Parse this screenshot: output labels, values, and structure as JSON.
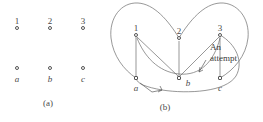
{
  "figure": {
    "caption_a": "(a)",
    "caption_b": "(b)",
    "annotation": "An\nattempt",
    "annotation_line1": "An",
    "annotation_line2": "attempt",
    "stroke_color": "#6b6b6b",
    "text_color": "#4a4a4a",
    "background": "#ffffff"
  },
  "panel_a": {
    "name": "six isolated vertices",
    "top_labels": [
      "1",
      "2",
      "3"
    ],
    "bottom_labels": [
      "a",
      "b",
      "c"
    ],
    "vertices": [
      {
        "id": "1",
        "label": "1",
        "x": 17,
        "y": 28,
        "label_pos": "above",
        "shape": "circle"
      },
      {
        "id": "2",
        "label": "2",
        "x": 50,
        "y": 28,
        "label_pos": "above",
        "shape": "circle"
      },
      {
        "id": "3",
        "label": "3",
        "x": 83,
        "y": 28,
        "label_pos": "above",
        "shape": "circle"
      },
      {
        "id": "a",
        "label": "a",
        "x": 17,
        "y": 73,
        "label_pos": "below",
        "shape": "circle"
      },
      {
        "id": "b",
        "label": "b",
        "x": 50,
        "y": 73,
        "label_pos": "below",
        "shape": "circle"
      },
      {
        "id": "c",
        "label": "c",
        "x": 83,
        "y": 73,
        "label_pos": "below",
        "shape": "circle"
      }
    ]
  },
  "panel_b": {
    "name": "attempted planar drawing of K33",
    "top_labels": [
      "1",
      "2",
      "3"
    ],
    "bottom_labels": [
      "a",
      "b",
      "c"
    ],
    "vertices": [
      {
        "id": "1",
        "label": "1",
        "x": 26,
        "y": 35,
        "label_pos": "above",
        "shape": "circle"
      },
      {
        "id": "2",
        "label": "2",
        "x": 69,
        "y": 38,
        "label_pos": "above",
        "shape": "circle"
      },
      {
        "id": "3",
        "label": "3",
        "x": 110,
        "y": 35,
        "label_pos": "above",
        "shape": "circle"
      },
      {
        "id": "a",
        "label": "a",
        "x": 26,
        "y": 78,
        "label_pos": "below",
        "shape": "square"
      },
      {
        "id": "b",
        "label": "b",
        "x": 69,
        "y": 78,
        "label_pos": "below",
        "shape": "square"
      },
      {
        "id": "c",
        "label": "c",
        "x": 110,
        "y": 78,
        "label_pos": "below",
        "shape": "square"
      }
    ],
    "edges": [
      {
        "from": "1",
        "to": "a",
        "style": "straight"
      },
      {
        "from": "1",
        "to": "b",
        "style": "straight"
      },
      {
        "from": "3",
        "to": "b",
        "style": "straight"
      },
      {
        "from": "3",
        "to": "c",
        "style": "straight"
      },
      {
        "from": "2",
        "to": "a",
        "style": "curve-left-outer"
      },
      {
        "from": "2",
        "to": "c",
        "style": "curve-right-outer"
      },
      {
        "from": "1",
        "to": "c",
        "style": "curve-bottom"
      },
      {
        "from": "3",
        "to": "a",
        "style": "curve-outer-top"
      },
      {
        "from": "2",
        "to": "b",
        "style": "short-straight"
      }
    ],
    "pointers": [
      {
        "name": "pointer-to-edge-a",
        "target": "a"
      },
      {
        "name": "pointer-to-edge-b",
        "target": "b"
      }
    ]
  }
}
